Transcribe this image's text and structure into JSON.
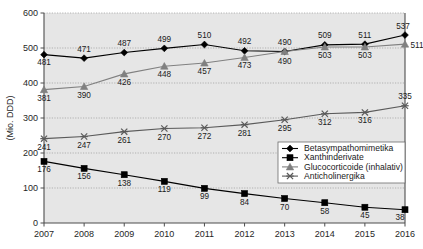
{
  "chart_data": {
    "type": "line",
    "title": "",
    "xlabel": "",
    "ylabel": "(Mio. DDD)",
    "categories": [
      "2007",
      "2008",
      "2009",
      "2010",
      "2011",
      "2012",
      "2013",
      "2014",
      "2015",
      "2016"
    ],
    "ylim": [
      0,
      600
    ],
    "yticks": [
      0,
      100,
      200,
      300,
      400,
      500,
      600
    ],
    "grid": true,
    "legend_position": "bottom-right",
    "series": [
      {
        "name": "Betasympathomimetika",
        "marker": "diamond",
        "color": "#000000",
        "values": [
          481,
          471,
          487,
          499,
          510,
          492,
          490,
          509,
          511,
          537
        ]
      },
      {
        "name": "Xanthinderivate",
        "marker": "square",
        "color": "#000000",
        "values": [
          176,
          156,
          138,
          119,
          99,
          84,
          70,
          58,
          45,
          38
        ]
      },
      {
        "name": "Glucocorticoide (inhalativ)",
        "marker": "triangle",
        "color": "#808080",
        "values": [
          381,
          390,
          426,
          448,
          457,
          473,
          490,
          503,
          503,
          511
        ]
      },
      {
        "name": "Anticholinergika",
        "marker": "x",
        "color": "#5a5a5a",
        "values": [
          241,
          247,
          261,
          270,
          272,
          281,
          295,
          312,
          316,
          335
        ]
      }
    ]
  },
  "axis": {
    "y_title": "(Mio. DDD)",
    "y_tick_labels": [
      "600",
      "500",
      "400",
      "300",
      "200",
      "100",
      "0"
    ],
    "x_tick_labels": [
      "2007",
      "2008",
      "2009",
      "2010",
      "2011",
      "2012",
      "2013",
      "2014",
      "2015",
      "2016"
    ]
  },
  "legend": {
    "items": [
      {
        "label": "Betasympathomimetika"
      },
      {
        "label": "Xanthinderivate"
      },
      {
        "label": "Glucocorticoide (inhalativ)"
      },
      {
        "label": "Anticholinergika"
      }
    ]
  },
  "colors": {
    "plot_background": "#e6e6e6",
    "page_background": "#ffffff",
    "axis": "#4d4d4d",
    "grid": "#9a9a9a",
    "series_dark": "#000000",
    "series_gray": "#808080",
    "series_midgray": "#5a5a5a"
  }
}
